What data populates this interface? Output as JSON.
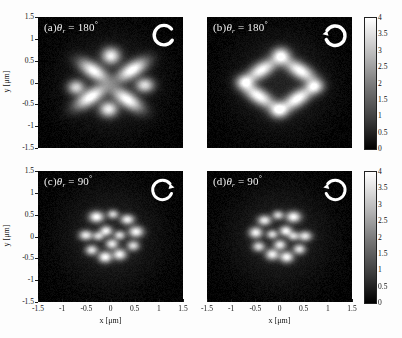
{
  "figure": {
    "axis_x_title": "x [μm]",
    "axis_y_title": "y [μm]",
    "xticks": [
      "-1.5",
      "-1",
      "-0.5",
      "0",
      "0.5",
      "1",
      "1.5"
    ],
    "yticks": [
      "1.5",
      "1",
      "0.5",
      "0",
      "-0.5",
      "-1",
      "-1.5"
    ],
    "cbar_ticks": [
      "4",
      "3.5",
      "3",
      "2.5",
      "2",
      "1.5",
      "1",
      "0.5",
      "0"
    ]
  },
  "panels": [
    {
      "id": "panel-a",
      "tag": "(a)",
      "symbol": "θ",
      "subscript": "r",
      "equals": "=",
      "value": "180",
      "degree": "°",
      "label_full": "(a) θr = 180°",
      "spin_icon": "rotation-arrow-clockwise-icon",
      "spin_direction": "clockwise"
    },
    {
      "id": "panel-b",
      "tag": "(b)",
      "symbol": "θ",
      "subscript": "r",
      "equals": "=",
      "value": "180",
      "degree": "°",
      "label_full": "(b) θr = 180°",
      "spin_icon": "rotation-arrow-counterclockwise-icon",
      "spin_direction": "counterclockwise"
    },
    {
      "id": "panel-c",
      "tag": "(c)",
      "symbol": "θ",
      "subscript": "r",
      "equals": "=",
      "value": "90",
      "degree": "°",
      "label_full": "(c) θr = 90°",
      "spin_icon": "rotation-arrow-clockwise-icon",
      "spin_direction": "clockwise"
    },
    {
      "id": "panel-d",
      "tag": "(d)",
      "symbol": "θ",
      "subscript": "r",
      "equals": "=",
      "value": "90",
      "degree": "°",
      "label_full": "(d) θr = 90°",
      "spin_icon": "rotation-arrow-counterclockwise-icon",
      "spin_direction": "counterclockwise"
    }
  ],
  "chart_data": {
    "type": "heatmap",
    "title": "",
    "xlabel": "x [μm]",
    "ylabel": "y [μm]",
    "xlim": [
      -1.5,
      1.5
    ],
    "ylim": [
      -1.5,
      1.5
    ],
    "clim": [
      0,
      4
    ],
    "colormap": "grayscale",
    "grid": false,
    "legend": "none",
    "colorbar": {
      "position": "right",
      "ticks": [
        0,
        0.5,
        1,
        1.5,
        2,
        2.5,
        3,
        3.5,
        4
      ],
      "count": 2,
      "shared_by": [
        "panel-a,panel-b",
        "panel-c,panel-d"
      ]
    },
    "panels": [
      {
        "id": "panel-a",
        "label": "(a) θr = 180°",
        "description": "six-lobed petal pattern, four elongated lobes plus two round spots",
        "blobs": [
          {
            "x": 0.0,
            "y": 0.62,
            "rx": 0.16,
            "ry": 0.16,
            "angle": 0,
            "peak": 3.6
          },
          {
            "x": 0.44,
            "y": 0.3,
            "rx": 0.3,
            "ry": 0.15,
            "angle": -32,
            "peak": 4.0
          },
          {
            "x": 0.7,
            "y": -0.05,
            "rx": 0.16,
            "ry": 0.14,
            "angle": 0,
            "peak": 3.2
          },
          {
            "x": 0.34,
            "y": -0.38,
            "rx": 0.3,
            "ry": 0.15,
            "angle": 34,
            "peak": 3.9
          },
          {
            "x": -0.05,
            "y": -0.6,
            "rx": 0.16,
            "ry": 0.15,
            "angle": 0,
            "peak": 3.5
          },
          {
            "x": -0.42,
            "y": -0.32,
            "rx": 0.31,
            "ry": 0.15,
            "angle": -33,
            "peak": 4.0
          },
          {
            "x": -0.72,
            "y": -0.1,
            "rx": 0.15,
            "ry": 0.14,
            "angle": 0,
            "peak": 3.0
          },
          {
            "x": -0.36,
            "y": 0.28,
            "rx": 0.29,
            "ry": 0.15,
            "angle": 33,
            "peak": 3.8
          }
        ]
      },
      {
        "id": "panel-b",
        "label": "(b) θr = 180°",
        "description": "six-lobed petal pattern mirrored relative to panel (a)",
        "blobs": [
          {
            "x": 0.02,
            "y": 0.62,
            "rx": 0.16,
            "ry": 0.16,
            "angle": 0,
            "peak": 3.6
          },
          {
            "x": 0.42,
            "y": 0.28,
            "rx": 0.3,
            "ry": 0.15,
            "angle": 32,
            "peak": 3.9
          },
          {
            "x": 0.72,
            "y": -0.08,
            "rx": 0.15,
            "ry": 0.14,
            "angle": 0,
            "peak": 3.1
          },
          {
            "x": 0.36,
            "y": -0.36,
            "rx": 0.3,
            "ry": 0.15,
            "angle": -33,
            "peak": 4.0
          },
          {
            "x": -0.02,
            "y": -0.62,
            "rx": 0.16,
            "ry": 0.15,
            "angle": 0,
            "peak": 3.5
          },
          {
            "x": -0.44,
            "y": -0.3,
            "rx": 0.31,
            "ry": 0.15,
            "angle": 33,
            "peak": 3.9
          },
          {
            "x": -0.72,
            "y": 0.02,
            "rx": 0.15,
            "ry": 0.14,
            "angle": 0,
            "peak": 3.0
          },
          {
            "x": -0.38,
            "y": 0.3,
            "rx": 0.29,
            "ry": 0.15,
            "angle": -32,
            "peak": 3.8
          }
        ]
      },
      {
        "id": "panel-c",
        "label": "(c) θr = 90°",
        "description": "dense speckled ring of many small bright spots",
        "blobs": [
          {
            "x": -0.3,
            "y": 0.46,
            "rx": 0.13,
            "ry": 0.11,
            "angle": 0,
            "peak": 3.8
          },
          {
            "x": 0.04,
            "y": 0.52,
            "rx": 0.1,
            "ry": 0.09,
            "angle": 0,
            "peak": 2.8
          },
          {
            "x": 0.34,
            "y": 0.4,
            "rx": 0.12,
            "ry": 0.1,
            "angle": 0,
            "peak": 3.4
          },
          {
            "x": 0.52,
            "y": 0.12,
            "rx": 0.13,
            "ry": 0.11,
            "angle": 0,
            "peak": 3.6
          },
          {
            "x": 0.46,
            "y": -0.2,
            "rx": 0.11,
            "ry": 0.1,
            "angle": 0,
            "peak": 3.0
          },
          {
            "x": 0.18,
            "y": -0.4,
            "rx": 0.12,
            "ry": 0.11,
            "angle": 0,
            "peak": 3.5
          },
          {
            "x": -0.12,
            "y": -0.46,
            "rx": 0.12,
            "ry": 0.11,
            "angle": 0,
            "peak": 3.7
          },
          {
            "x": -0.4,
            "y": -0.3,
            "rx": 0.11,
            "ry": 0.1,
            "angle": 0,
            "peak": 3.1
          },
          {
            "x": -0.52,
            "y": 0.04,
            "rx": 0.12,
            "ry": 0.1,
            "angle": 0,
            "peak": 3.3
          },
          {
            "x": -0.1,
            "y": 0.14,
            "rx": 0.11,
            "ry": 0.1,
            "angle": 0,
            "peak": 3.4
          },
          {
            "x": 0.18,
            "y": 0.04,
            "rx": 0.1,
            "ry": 0.09,
            "angle": 0,
            "peak": 2.9
          },
          {
            "x": 0.02,
            "y": -0.16,
            "rx": 0.11,
            "ry": 0.1,
            "angle": 0,
            "peak": 3.2
          },
          {
            "x": -0.26,
            "y": 0.02,
            "rx": 0.1,
            "ry": 0.09,
            "angle": 0,
            "peak": 2.7
          }
        ]
      },
      {
        "id": "panel-d",
        "label": "(d) θr = 90°",
        "description": "dense speckled ring of many small bright spots, mirrored",
        "blobs": [
          {
            "x": 0.28,
            "y": 0.46,
            "rx": 0.13,
            "ry": 0.11,
            "angle": 0,
            "peak": 3.7
          },
          {
            "x": -0.04,
            "y": 0.5,
            "rx": 0.1,
            "ry": 0.09,
            "angle": 0,
            "peak": 2.8
          },
          {
            "x": -0.32,
            "y": 0.38,
            "rx": 0.12,
            "ry": 0.1,
            "angle": 0,
            "peak": 3.3
          },
          {
            "x": -0.5,
            "y": 0.1,
            "rx": 0.12,
            "ry": 0.11,
            "angle": 0,
            "peak": 3.5
          },
          {
            "x": -0.44,
            "y": -0.22,
            "rx": 0.11,
            "ry": 0.1,
            "angle": 0,
            "peak": 3.0
          },
          {
            "x": -0.16,
            "y": -0.4,
            "rx": 0.12,
            "ry": 0.11,
            "angle": 0,
            "peak": 3.4
          },
          {
            "x": 0.14,
            "y": -0.46,
            "rx": 0.12,
            "ry": 0.11,
            "angle": 0,
            "peak": 3.6
          },
          {
            "x": 0.4,
            "y": -0.28,
            "rx": 0.11,
            "ry": 0.1,
            "angle": 0,
            "peak": 3.1
          },
          {
            "x": 0.52,
            "y": 0.02,
            "rx": 0.12,
            "ry": 0.1,
            "angle": 0,
            "peak": 3.2
          },
          {
            "x": 0.12,
            "y": 0.14,
            "rx": 0.11,
            "ry": 0.1,
            "angle": 0,
            "peak": 3.5
          },
          {
            "x": -0.16,
            "y": 0.06,
            "rx": 0.1,
            "ry": 0.09,
            "angle": 0,
            "peak": 2.9
          },
          {
            "x": 0.0,
            "y": -0.18,
            "rx": 0.11,
            "ry": 0.1,
            "angle": 0,
            "peak": 3.2
          },
          {
            "x": 0.28,
            "y": 0.02,
            "rx": 0.1,
            "ry": 0.09,
            "angle": 0,
            "peak": 2.7
          }
        ]
      }
    ]
  }
}
